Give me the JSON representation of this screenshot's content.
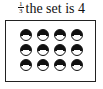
{
  "caption": {
    "fraction": {
      "numerator": "1",
      "denominator": "3"
    },
    "text": "the set is 4"
  },
  "set": {
    "rows": 3,
    "columns": 4,
    "total": 12,
    "item_icon": "half-shaded-circle-icon",
    "dot_color": "#111111"
  }
}
